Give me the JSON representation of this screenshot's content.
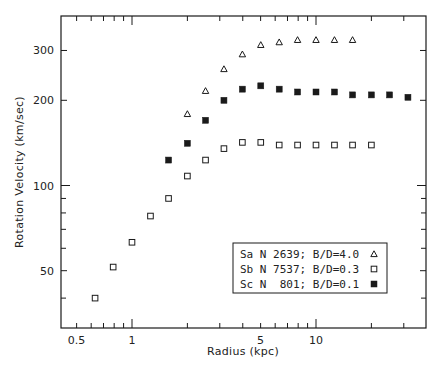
{
  "chart_data": {
    "type": "scatter",
    "title": "",
    "xlabel": "Radius (kpc)",
    "ylabel": "Rotation Velocity (km/sec)",
    "xscale": "log",
    "yscale": "log",
    "xlim": [
      0.38,
      40
    ],
    "ylim": [
      31,
      365
    ],
    "x_ticks_labeled": [
      {
        "value": 0.5,
        "label": "0.5"
      },
      {
        "value": 1,
        "label": "1"
      },
      {
        "value": 5,
        "label": "5"
      },
      {
        "value": 10,
        "label": "10"
      }
    ],
    "x_ticks_minor": [
      0.6,
      0.7,
      0.8,
      0.9,
      2,
      3,
      4,
      6,
      7,
      8,
      9,
      20,
      30
    ],
    "y_ticks_labeled": [
      {
        "value": 50,
        "label": "50"
      },
      {
        "value": 100,
        "label": "100"
      },
      {
        "value": 200,
        "label": "200"
      },
      {
        "value": 300,
        "label": "300"
      }
    ],
    "y_ticks_minor": [
      40,
      60,
      70,
      80,
      90
    ],
    "grid": false,
    "legend_position": "lower right",
    "series": [
      {
        "name": "Sa N 2639; B/D=4.0",
        "marker": "open-triangle",
        "x": [
          2.0,
          2.51,
          3.16,
          3.98,
          5.01,
          6.31,
          7.94,
          10.0,
          12.6,
          15.8
        ],
        "y": [
          179,
          216,
          258,
          291,
          314,
          321,
          327,
          327,
          327,
          327
        ]
      },
      {
        "name": "Sb N 7537; B/D=0.3",
        "marker": "open-square",
        "x": [
          0.63,
          0.79,
          1.0,
          1.26,
          1.58,
          2.0,
          2.51,
          3.16,
          3.98,
          5.01,
          6.31,
          7.94,
          10.0,
          12.6,
          15.8,
          20.0
        ],
        "y": [
          40,
          51.5,
          63,
          78,
          90,
          108,
          123,
          135,
          142,
          142,
          139,
          139,
          139,
          139,
          139,
          139
        ]
      },
      {
        "name": "Sc N  801; B/D=0.1",
        "marker": "filled-square",
        "x": [
          1.58,
          2.0,
          2.51,
          3.16,
          3.98,
          5.01,
          6.31,
          7.94,
          10.0,
          12.6,
          15.8,
          20.0,
          25.1,
          31.6
        ],
        "y": [
          123,
          141,
          170,
          200,
          219,
          225,
          219,
          214,
          214,
          214,
          209,
          209,
          209,
          205
        ]
      }
    ]
  },
  "legend": {
    "entries": [
      {
        "label": "Sa N 2639; B/D=4.0",
        "marker": "open-triangle"
      },
      {
        "label": "Sb N 7537; B/D=0.3",
        "marker": "open-square"
      },
      {
        "label": "Sc N  801; B/D=0.1",
        "marker": "filled-square"
      }
    ]
  },
  "colors": {
    "ink": "#1a1a1a",
    "background": "#ffffff"
  }
}
